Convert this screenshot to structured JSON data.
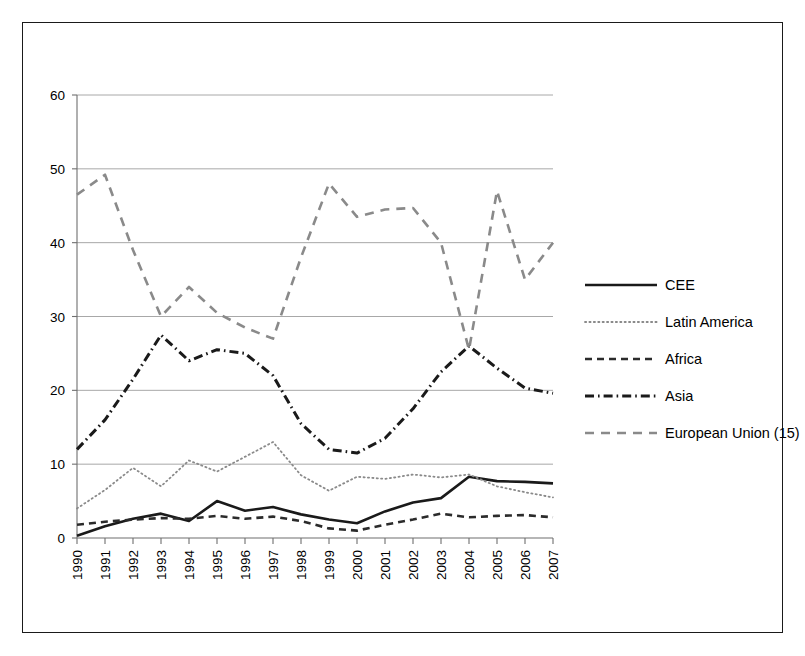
{
  "chart_data": {
    "type": "line",
    "title": "",
    "subtitle": "",
    "xlabel": "",
    "ylabel": "",
    "categories": [
      "1990",
      "1991",
      "1992",
      "1993",
      "1994",
      "1995",
      "1996",
      "1997",
      "1998",
      "1999",
      "2000",
      "2001",
      "2002",
      "2003",
      "2004",
      "2005",
      "2006",
      "2007"
    ],
    "ylim": [
      0,
      60
    ],
    "yticks": [
      0,
      10,
      20,
      30,
      40,
      50,
      60
    ],
    "grid": true,
    "legend_position": "right",
    "series": [
      {
        "name": "CEE",
        "style": "solid",
        "color": "#1a1a1a",
        "width": 2.6,
        "values": [
          0.3,
          1.6,
          2.6,
          3.3,
          2.3,
          5.0,
          3.7,
          4.2,
          3.2,
          2.5,
          2.0,
          3.6,
          4.8,
          5.4,
          8.3,
          7.7,
          7.6,
          7.4
        ]
      },
      {
        "name": "Latin America",
        "style": "dotted",
        "color": "#8a8a8a",
        "width": 1.8,
        "values": [
          4.0,
          6.5,
          9.5,
          7.0,
          10.5,
          9.0,
          11.0,
          13.0,
          8.5,
          6.4,
          8.3,
          8.0,
          8.6,
          8.2,
          8.6,
          7.0,
          6.2,
          5.5
        ]
      },
      {
        "name": "Africa",
        "style": "dashed",
        "color": "#2b2b2b",
        "width": 2.6,
        "values": [
          1.8,
          2.2,
          2.5,
          2.7,
          2.6,
          3.0,
          2.6,
          2.9,
          2.3,
          1.3,
          1.0,
          1.8,
          2.5,
          3.3,
          2.8,
          3.0,
          3.1,
          2.8
        ]
      },
      {
        "name": "Asia",
        "style": "dashdot",
        "color": "#1a1a1a",
        "width": 3.0,
        "values": [
          12.0,
          16.0,
          21.5,
          27.5,
          24.0,
          25.5,
          25.0,
          22.0,
          15.5,
          12.0,
          11.5,
          13.5,
          17.5,
          22.5,
          26.0,
          23.0,
          20.3,
          19.6
        ]
      },
      {
        "name": "European Union (15)",
        "style": "longdash",
        "color": "#8a8a8a",
        "width": 2.6,
        "values": [
          46.5,
          49.2,
          39.0,
          30.0,
          34.0,
          30.5,
          28.5,
          27.0,
          38.0,
          48.0,
          43.5,
          44.5,
          44.7,
          40.0,
          25.5,
          47.0,
          35.0,
          40.0
        ]
      }
    ]
  },
  "legend": {
    "items": [
      {
        "label": "CEE"
      },
      {
        "label": "Latin America"
      },
      {
        "label": "Africa"
      },
      {
        "label": "Asia"
      },
      {
        "label": "European Union (15)"
      }
    ]
  }
}
